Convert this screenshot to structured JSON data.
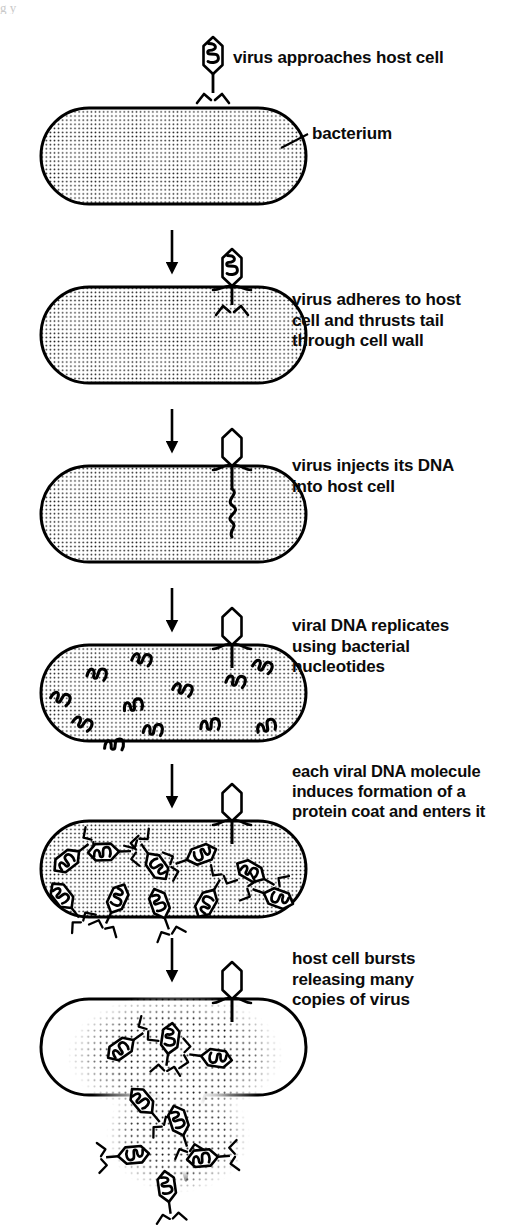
{
  "figure": {
    "ink_color": "#000000",
    "background_color": "#ffffff",
    "stipple_color": "#1a1a1a",
    "scan_artifact_text": "g y"
  },
  "steps": [
    {
      "id": "step-1",
      "caption": "virus approaches host cell",
      "cell_label": "bacterium",
      "cell_fill": "stipple",
      "virus_state": "free-floating above cell, DNA inside head",
      "contents": "none"
    },
    {
      "id": "step-2",
      "caption": "virus adheres to host\ncell and thrusts tail\nthrough cell wall",
      "cell_fill": "stipple",
      "virus_state": "attached on cell surface, DNA inside head",
      "contents": "none"
    },
    {
      "id": "step-3",
      "caption": "virus injects its DNA\ninto host cell",
      "cell_fill": "stipple",
      "virus_state": "attached, head empty",
      "contents": "one DNA strand descending from tail"
    },
    {
      "id": "step-4",
      "caption": "viral DNA replicates\nusing bacterial\nnucleotides",
      "cell_fill": "stipple",
      "virus_state": "attached, head empty",
      "contents": "12 replicated DNA squiggles"
    },
    {
      "id": "step-5",
      "caption": "each viral DNA molecule\ninduces formation of a\nprotein coat and enters it",
      "cell_fill": "stipple",
      "virus_state": "attached, head empty",
      "contents": "10 assembled virions with protein coats"
    },
    {
      "id": "step-6",
      "caption": "host cell bursts\nreleasing many\ncopies of virus",
      "cell_fill": "white with dotted cloud",
      "virus_state": "attached, head empty",
      "contents": "virions spilling out through ruptured bottom wall"
    }
  ],
  "arrows": {
    "label": "downward progression arrow",
    "count": 5,
    "direction": "down"
  }
}
